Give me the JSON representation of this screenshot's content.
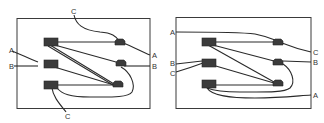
{
  "diagrams": [
    {
      "id": "left",
      "labels": {
        "top_c": "C",
        "left_a": "A",
        "left_b": "B",
        "right_a": "A",
        "right_b": "B",
        "bottom_c": "C"
      }
    },
    {
      "id": "right",
      "labels": {
        "left_a": "A",
        "left_b": "B",
        "left_c": "C",
        "right_c": "C",
        "right_b": "B",
        "right_a": "A"
      }
    }
  ],
  "colors": {
    "stroke": "#2a2a2a",
    "fill": "#3b3b3b",
    "background": "#ffffff"
  }
}
